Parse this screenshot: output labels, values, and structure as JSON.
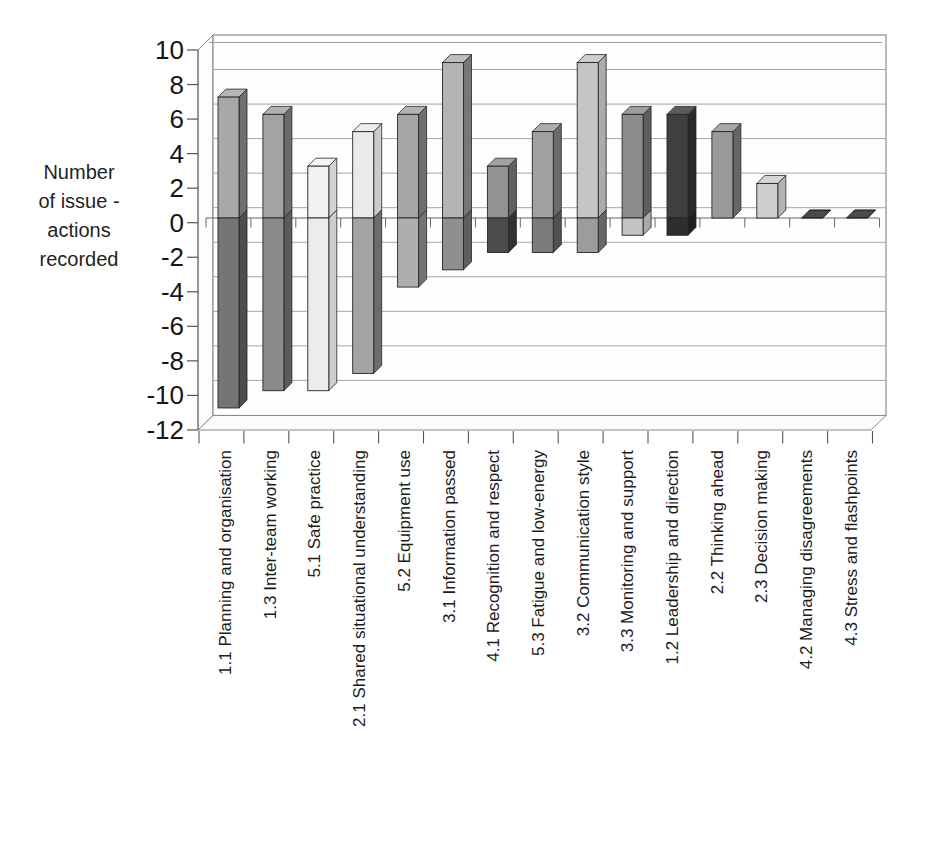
{
  "chart": {
    "y_axis_title_lines": [
      "Number",
      "of issue -",
      "actions",
      "recorded"
    ]
  },
  "chart_data": {
    "type": "bar",
    "style": "3d-column, positive and negative segments per category, no legend, no title",
    "title": "",
    "xlabel": "",
    "ylabel": "Number of issue - actions recorded",
    "ylim": [
      -12,
      10
    ],
    "ytick_interval": 2,
    "ytick_labels": [
      "10",
      "8",
      "6",
      "4",
      "2",
      "0",
      "-2",
      "-4",
      "-6",
      "-8",
      "-10",
      "-12"
    ],
    "grid": true,
    "legend_position": "none",
    "categories": [
      "1.1 Planning and organisation",
      "1.3 Inter-team working",
      "5.1 Safe practice",
      "2.1 Shared situational understanding",
      "5.2 Equipment use",
      "3.1 Information passed",
      "4.1 Recognition and respect",
      "5.3 Fatigue and low-energy",
      "3.2 Communication style",
      "3.3 Monitoring and support",
      "1.2 Leadership and direction",
      "2.2 Thinking ahead",
      "2.3 Decision making",
      "4.2 Managing disagreements",
      "4.3 Stress and flashpoints"
    ],
    "series": [
      {
        "name": "positive",
        "values": [
          7,
          6,
          3,
          5,
          6,
          9,
          3,
          5,
          9,
          6,
          6,
          5,
          2,
          0,
          0
        ]
      },
      {
        "name": "negative",
        "values": [
          -11,
          -10,
          -10,
          -9,
          -4,
          -3,
          -2,
          -2,
          -2,
          -1,
          -1,
          0,
          0,
          0,
          0
        ]
      }
    ],
    "bar_colors_positive": [
      "#a8a8a8",
      "#a3a3a3",
      "#f2f2f2",
      "#eaeaea",
      "#a6a6a6",
      "#b4b4b4",
      "#929292",
      "#a0a0a0",
      "#c5c5c5",
      "#8d8d8d",
      "#3f3f3f",
      "#9a9a9a",
      "#cfcfcf",
      "#4a4a4a",
      "#4a4a4a"
    ],
    "bar_colors_negative": [
      "#757575",
      "#8a8a8a",
      "#ececec",
      "#a3a3a3",
      "#aeaeae",
      "#8f8f8f",
      "#4c4c4c",
      "#7b7b7b",
      "#9c9c9c",
      "#c2c2c2",
      "#2e2e2e",
      "#9a9a9a",
      "#cfcfcf",
      "#4a4a4a",
      "#4a4a4a"
    ],
    "axis_color": "#666666",
    "gridline_color": "#a6a6a6",
    "wall_edge_color": "#8c8c8c",
    "bar_outline_color": "#262626"
  }
}
